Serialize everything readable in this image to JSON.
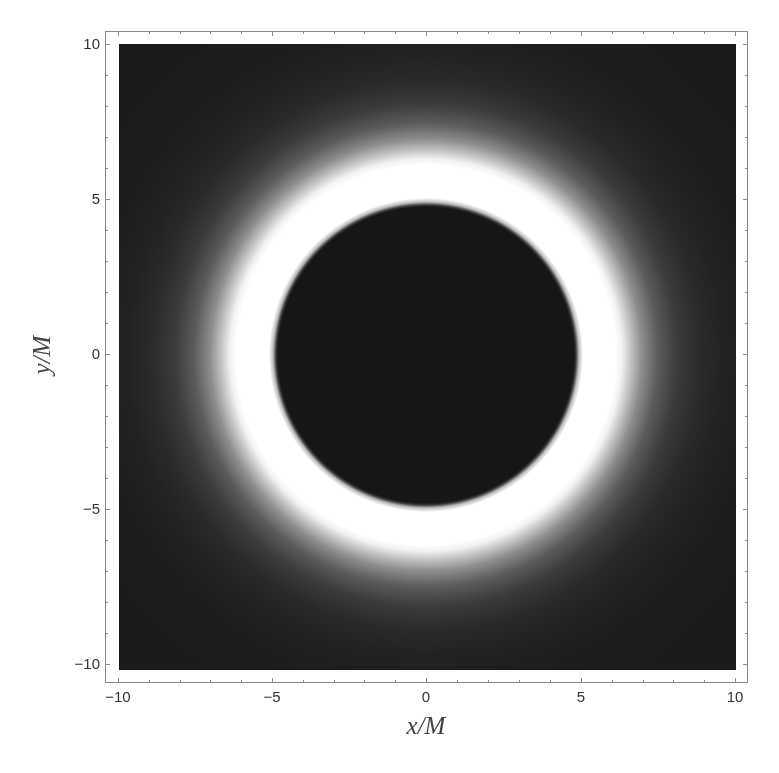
{
  "chart_data": {
    "type": "heatmap",
    "title": "",
    "xlabel": "x/M",
    "ylabel": "y/M",
    "xlim": [
      -10,
      10
    ],
    "ylim": [
      -10,
      10
    ],
    "x_ticks": [
      "-10",
      "-5",
      "0",
      "5",
      "10"
    ],
    "y_ticks": [
      "10",
      "5",
      "0",
      "-5",
      "-10"
    ],
    "grid": false,
    "legend": null,
    "colormap": "grayscale",
    "features": {
      "shadow_disk": {
        "center": [
          0,
          0
        ],
        "radius": 4.95,
        "intensity": 0.08
      },
      "bright_ring": {
        "inner_radius": 4.95,
        "outer_radius": 6.3,
        "intensity": 1.0
      },
      "halo": {
        "from_radius": 6.3,
        "to_radius": 9.0,
        "intensity_range": [
          1.0,
          0.12
        ]
      },
      "background_intensity": 0.1
    }
  },
  "axes": {
    "x_ticks": [
      {
        "label": "−10",
        "px": 118
      },
      {
        "label": "−5",
        "px": 272
      },
      {
        "label": "0",
        "px": 426
      },
      {
        "label": "5",
        "px": 581
      },
      {
        "label": "10",
        "px": 735
      }
    ],
    "y_ticks": [
      {
        "label": "10",
        "px": 44
      },
      {
        "label": "5",
        "px": 199
      },
      {
        "label": "0",
        "px": 354
      },
      {
        "label": "−5",
        "px": 509
      },
      {
        "label": "−10",
        "px": 664
      }
    ],
    "xlabel": "x/M",
    "ylabel": "y/M"
  }
}
